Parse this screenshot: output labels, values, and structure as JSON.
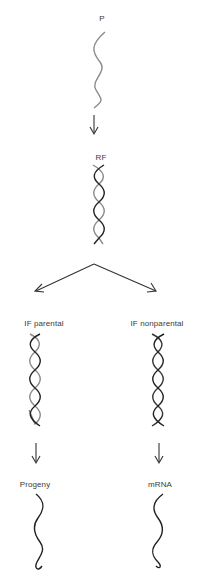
{
  "diagram": {
    "nodes": [
      {
        "id": "p",
        "label": "P",
        "type": "single-strand",
        "x": 101,
        "y": 20
      },
      {
        "id": "rf",
        "label": "RF",
        "type": "double-helix",
        "x": 100,
        "y": 157
      },
      {
        "id": "if-parental",
        "label": "IF parental",
        "type": "double-helix",
        "x": 27,
        "y": 323
      },
      {
        "id": "if-nonparental",
        "label": "IF nonparental",
        "type": "double-helix",
        "x": 159,
        "y": 323
      },
      {
        "id": "progeny",
        "label": "Progeny",
        "type": "single-strand",
        "x": 27,
        "y": 484
      },
      {
        "id": "mrna",
        "label": "mRNA",
        "type": "single-strand",
        "x": 159,
        "y": 484
      }
    ],
    "edges": [
      {
        "from": "p",
        "to": "rf"
      },
      {
        "from": "rf",
        "to": "if-parental"
      },
      {
        "from": "rf",
        "to": "if-nonparental"
      },
      {
        "from": "if-parental",
        "to": "progeny"
      },
      {
        "from": "if-nonparental",
        "to": "mrna"
      }
    ]
  },
  "colors": {
    "strand_light": "#8a8a8a",
    "strand_dark": "#222222",
    "arrow": "#333333"
  }
}
